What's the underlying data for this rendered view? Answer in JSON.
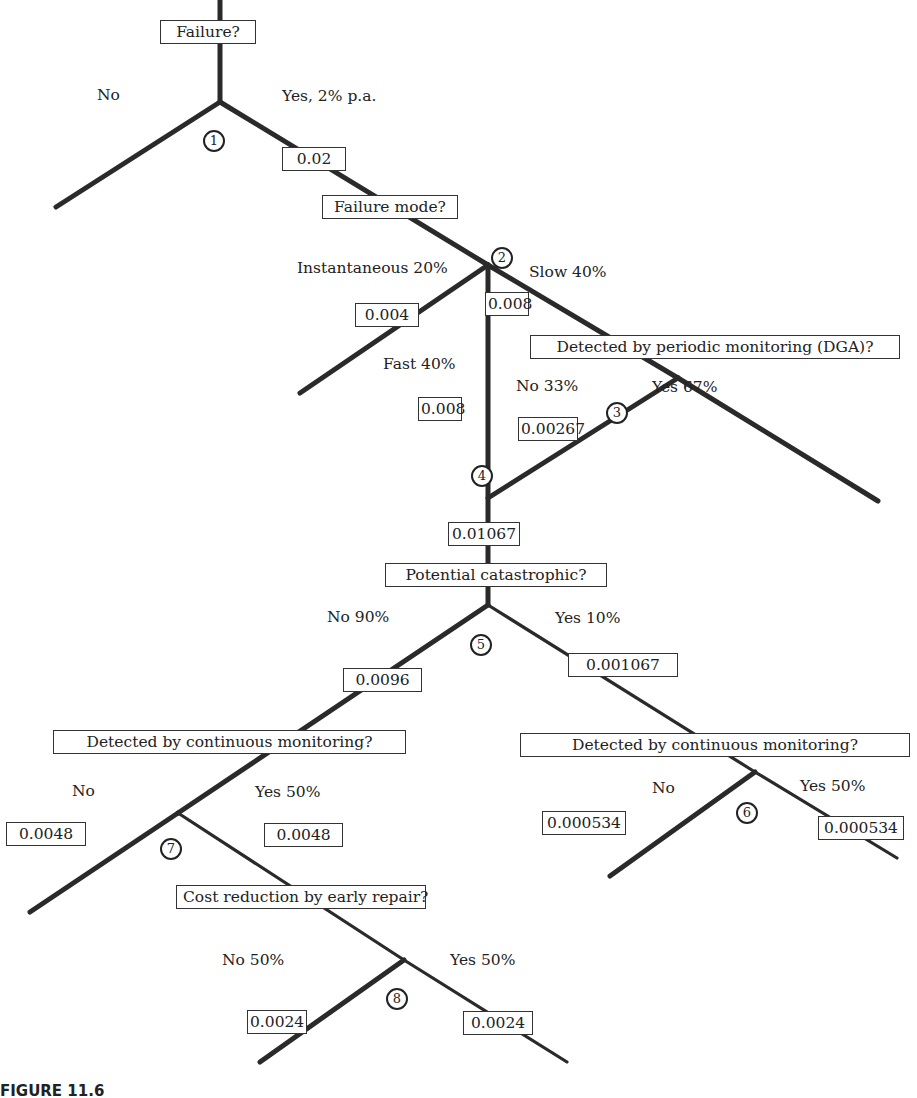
{
  "decisions": {
    "failure": "Failure?",
    "failure_mode": "Failure mode?",
    "periodic_monitoring": "Detected by periodic monitoring (DGA)?",
    "potential_catastrophic": "Potential catastrophic?",
    "continuous_left": "Detected by continuous monitoring?",
    "continuous_right": "Detected by continuous monitoring?",
    "cost_reduction": "Cost reduction by early repair?"
  },
  "branch_labels": {
    "failure_no": "No",
    "failure_yes": "Yes, 2% p.a.",
    "instantaneous": "Instantaneous 20%",
    "slow": "Slow 40%",
    "fast": "Fast 40%",
    "dga_no": "No 33%",
    "dga_yes": "Yes 67%",
    "cat_no": "No 90%",
    "cat_yes": "Yes 10%",
    "cont_left_no": "No",
    "cont_left_yes": "Yes 50%",
    "cont_right_no": "No",
    "cont_right_yes": "Yes 50%",
    "cost_no": "No 50%",
    "cost_yes": "Yes 50%"
  },
  "probabilities": {
    "p_failure": "0.02",
    "p_instantaneous": "0.004",
    "p_slow": "0.008",
    "p_fast": "0.008",
    "p_dga_no": "0.00267",
    "p_combined": "0.01067",
    "p_cat_no": "0.0096",
    "p_cat_yes": "0.001067",
    "p_cont_left_no": "0.0048",
    "p_cont_left_yes": "0.0048",
    "p_cont_right_no": "0.000534",
    "p_cont_right_yes": "0.000534",
    "p_cost_no": "0.0024",
    "p_cost_yes": "0.0024"
  },
  "nodes": [
    "1",
    "2",
    "3",
    "4",
    "5",
    "6",
    "7",
    "8"
  ],
  "caption": "FIGURE 11.6"
}
